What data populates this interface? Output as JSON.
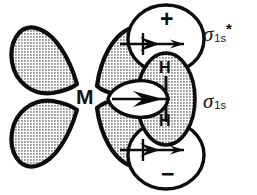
{
  "figure": {
    "kind": "orbital-interaction-diagram",
    "background_color": "#ffffff",
    "ink_color": "#0d0d0d",
    "lobe_fill": "halftone-dot-gray"
  },
  "center": {
    "metal_label": "M"
  },
  "labels": {
    "sigma_antibonding": {
      "symbol": "σ",
      "subscript": "1s",
      "superscript": "*"
    },
    "sigma_bonding": {
      "symbol": "σ",
      "subscript": "1s",
      "superscript": ""
    }
  },
  "hydrogen": {
    "top_atom": "H",
    "bottom_atom": "H"
  },
  "phase_signs": {
    "top": "+",
    "bottom": "−"
  },
  "metal_orbital": {
    "name": "d-orbital",
    "lobes": [
      {
        "id": "upper-left",
        "shaded": true
      },
      {
        "id": "lower-left",
        "shaded": true
      },
      {
        "id": "upper-right",
        "shaded": true
      },
      {
        "id": "lower-right",
        "shaded": true
      }
    ]
  },
  "h2_orbitals": {
    "sigma_star_lobes": [
      {
        "id": "sigma-star-top",
        "shaded": false,
        "sign": "+"
      },
      {
        "id": "sigma-star-bottom",
        "shaded": false,
        "sign": "−"
      }
    ],
    "sigma_bonding_lobe": {
      "id": "sigma-1s-ellipse",
      "shaded": true
    },
    "sigma_donation_lobe": {
      "id": "sigma-donation-white-lobe",
      "shaded": false
    }
  },
  "arrows": [
    {
      "id": "backdonation-top",
      "direction": "right",
      "double_headed": true
    },
    {
      "id": "sigma-donation-mid",
      "direction": "right",
      "double_headed": true
    },
    {
      "id": "backdonation-bottom",
      "direction": "right",
      "double_headed": true
    }
  ]
}
